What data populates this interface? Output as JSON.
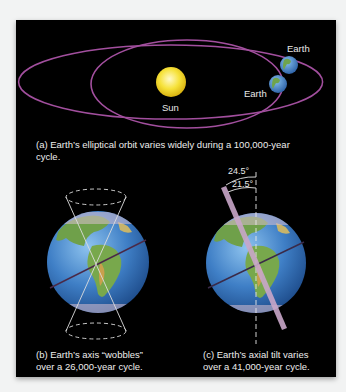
{
  "figure": {
    "panel_a": {
      "labels": {
        "sun": "Sun",
        "earth_outer": "Earth",
        "earth_inner": "Earth"
      },
      "caption_line1": "(a) Earth’s elliptical orbit varies widely during a 100,000-year",
      "caption_line2": "cycle."
    },
    "panel_b": {
      "caption_line1": "(b) Earth’s axis “wobbles”",
      "caption_line2": "over a 26,000-year cycle."
    },
    "panel_c": {
      "angle_max": "24.5°",
      "angle_min": "21.5°",
      "caption_line1": "(c) Earth’s axial tilt varies",
      "caption_line2": "over a 41,000-year cycle."
    },
    "colors": {
      "background": "#000000",
      "orbit": "#a24f9e",
      "sun": "#f4dc2a",
      "ocean": "#3d7cc4",
      "land": "#6ea04a",
      "axis_bar": "#c9a6c9"
    }
  }
}
